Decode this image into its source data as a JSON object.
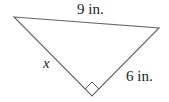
{
  "figure": {
    "type": "right-triangle",
    "vertices": {
      "left": [
        14,
        17
      ],
      "right": [
        159,
        28
      ],
      "right_angle": [
        92,
        96
      ]
    },
    "sides": {
      "hypotenuse": {
        "label": "9 in.",
        "length": 9,
        "unit": "in."
      },
      "leg_left": {
        "label": "x",
        "unknown": true
      },
      "leg_right": {
        "label": "6 in.",
        "length": 6,
        "unit": "in."
      }
    },
    "right_angle_marker": true,
    "colors": {
      "stroke": "#666666",
      "text": "#222222",
      "background": "#ffffff"
    }
  }
}
